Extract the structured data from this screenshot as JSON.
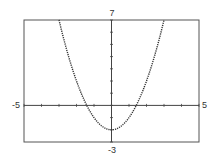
{
  "chart_data": {
    "type": "line",
    "title": "",
    "xlabel": "",
    "ylabel": "",
    "function": "y = x^2 - 2",
    "xlim": [
      -5,
      5
    ],
    "ylim": [
      -3,
      7
    ],
    "grid": false,
    "x_ticks_step": 1,
    "y_ticks_step": 1,
    "tick_labels": {
      "xmin": "-5",
      "xmax": "5",
      "ymin": "-3",
      "ymax": "7"
    },
    "series": [
      {
        "name": "curve",
        "style": "dotted",
        "x": [
          -3,
          -2.5,
          -2,
          -1.5,
          -1.414,
          -1,
          -0.5,
          0,
          0.5,
          1,
          1.414,
          1.5,
          2,
          2.5,
          3
        ],
        "y": [
          7,
          4.25,
          2,
          0.25,
          0,
          -1,
          -1.75,
          -2,
          -1.75,
          -1,
          0,
          0.25,
          2,
          4.25,
          7
        ]
      }
    ]
  },
  "colors": {
    "frame": "#555555",
    "axis": "#444444",
    "curve": "#333333",
    "background": "#ffffff"
  }
}
